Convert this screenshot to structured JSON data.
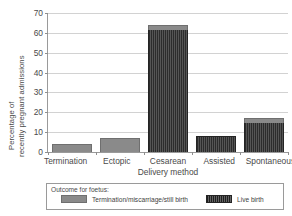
{
  "chart_data": {
    "type": "bar",
    "stacked": true,
    "title": "",
    "xlabel": "Delivery method",
    "ylabel": "Percentage of recently pregnant admissions",
    "ylabel_lines": [
      "Percentage of",
      "recently pregnant admissions"
    ],
    "categories": [
      "Termination",
      "Ectopic",
      "Cesarean",
      "Assisted",
      "Spontaneous"
    ],
    "series": [
      {
        "name": "Termination/miscarriage/still birth",
        "color": "#8a8a8a",
        "values": [
          4,
          7,
          2.5,
          0,
          2.5
        ]
      },
      {
        "name": "Live birth",
        "color": "#3b3b3b",
        "values": [
          0,
          0,
          61.5,
          8,
          14.5
        ]
      }
    ],
    "totals": [
      4,
      7,
      64,
      8,
      17
    ],
    "ylim": [
      0,
      70
    ],
    "yticks": [
      0,
      10,
      20,
      30,
      40,
      50,
      60,
      70
    ],
    "ytick_labels": [
      "0",
      "10",
      "20",
      "30",
      "40",
      "50",
      "60",
      "70"
    ],
    "grid": true,
    "legend_position": "below-plot",
    "legend_title": "Outcome for foetus:"
  },
  "legend": {
    "title": "Outcome for foetus:",
    "items": [
      {
        "label": "Termination/miscarriage/still birth",
        "swatch": "termination-swatch"
      },
      {
        "label": "Live birth",
        "swatch": "live-birth-swatch"
      }
    ]
  }
}
